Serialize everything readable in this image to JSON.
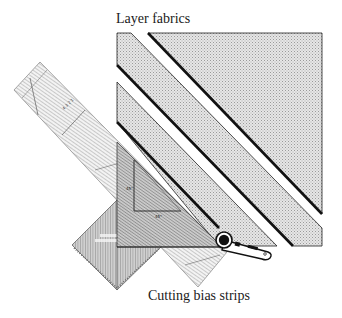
{
  "diagram": {
    "labels": {
      "top": "Layer fabrics",
      "bottom": "Cutting bias strips"
    },
    "colors": {
      "fabric_fill": "#d9d9d9",
      "outline": "#111111",
      "ruler_fill": "#cfcfcf",
      "ruler_hatch": "#8a8a8a",
      "background": "#ffffff"
    },
    "elements": {
      "fabric_pieces": [
        "large-corner-triangle",
        "bias-strip-1",
        "bias-strip-2"
      ],
      "tools": [
        "long-ruler",
        "triangle-ruler",
        "square-ruler",
        "rotary-cutter"
      ]
    }
  }
}
